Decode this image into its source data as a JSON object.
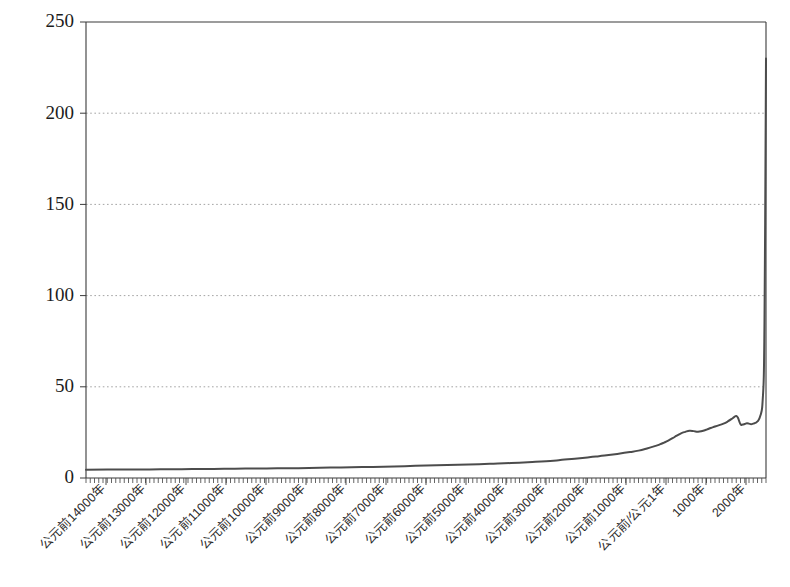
{
  "chart_data": {
    "type": "line",
    "title": "",
    "subtitle": "",
    "xlabel": "",
    "ylabel": "",
    "grid": "horizontal-dotted",
    "legend": "none",
    "ylim": [
      0,
      250
    ],
    "yticks": [
      0,
      50,
      100,
      150,
      200,
      250
    ],
    "ytick_labels": [
      "0",
      "50",
      "100",
      "150",
      "200",
      "250"
    ],
    "xlim": [
      -14000,
      2000
    ],
    "xtick_labels": [
      "公元前14000年",
      "公元前13000年",
      "公元前12000年",
      "公元前11000年",
      "公元前10000年",
      "公元前9000年",
      "公元前8000年",
      "公元前7000年",
      "公元前6000年",
      "公元前5000年",
      "公元前4000年",
      "公元前3000年",
      "公元前2000年",
      "公元前1000年",
      "公元前/公元1年",
      "1000年",
      "2000年"
    ],
    "xtick_values": [
      -14000,
      -13000,
      -12000,
      -11000,
      -10000,
      -9000,
      -8000,
      -7000,
      -6000,
      -5000,
      -4000,
      -3000,
      -2000,
      -1000,
      1,
      1000,
      2000
    ],
    "series": [
      {
        "name": "世界人口",
        "color": "#4c4c4c",
        "x": [
          -14000,
          -13500,
          -13000,
          -12500,
          -12000,
          -11500,
          -11000,
          -10500,
          -10000,
          -9500,
          -9000,
          -8500,
          -8000,
          -7500,
          -7000,
          -6500,
          -6000,
          -5500,
          -5000,
          -4500,
          -4000,
          -3500,
          -3000,
          -2800,
          -2500,
          -2200,
          -2000,
          -1800,
          -1500,
          -1200,
          -1000,
          -800,
          -600,
          -500,
          -400,
          -300,
          -200,
          -100,
          1,
          100,
          200,
          300,
          400,
          500,
          600,
          700,
          800,
          900,
          1000,
          1100,
          1200,
          1250,
          1300,
          1340,
          1400,
          1450,
          1500,
          1550,
          1600,
          1650,
          1700,
          1750,
          1800,
          1850,
          1900,
          1920,
          1940,
          1950,
          1960,
          1970,
          1980,
          1990,
          2000
        ],
        "y": [
          4.5,
          4.6,
          4.7,
          4.7,
          4.8,
          4.9,
          5.0,
          5.1,
          5.2,
          5.3,
          5.4,
          5.6,
          5.8,
          6.0,
          6.2,
          6.5,
          6.8,
          7.1,
          7.4,
          7.8,
          8.2,
          8.8,
          9.5,
          10.0,
          10.6,
          11.3,
          11.8,
          12.3,
          13.2,
          14.2,
          15.0,
          16.2,
          17.6,
          18.4,
          19.4,
          20.5,
          21.8,
          23.2,
          24.5,
          25.3,
          25.9,
          25.7,
          25.4,
          25.8,
          26.5,
          27.4,
          28.2,
          29.0,
          29.8,
          31.0,
          32.5,
          33.4,
          34.0,
          33.0,
          29.5,
          29.3,
          29.6,
          30.0,
          29.8,
          29.5,
          29.8,
          30.2,
          31.0,
          33.0,
          37.0,
          42.0,
          50.0,
          58.0,
          75.0,
          105.0,
          140.0,
          185.0,
          230.0
        ]
      }
    ],
    "annotations": []
  },
  "colors": {
    "curve": "#4c4c4c",
    "axis": "#3a3a3a",
    "grid": "#9a9a9a",
    "background": "#ffffff",
    "text": "#1c1c1c"
  }
}
